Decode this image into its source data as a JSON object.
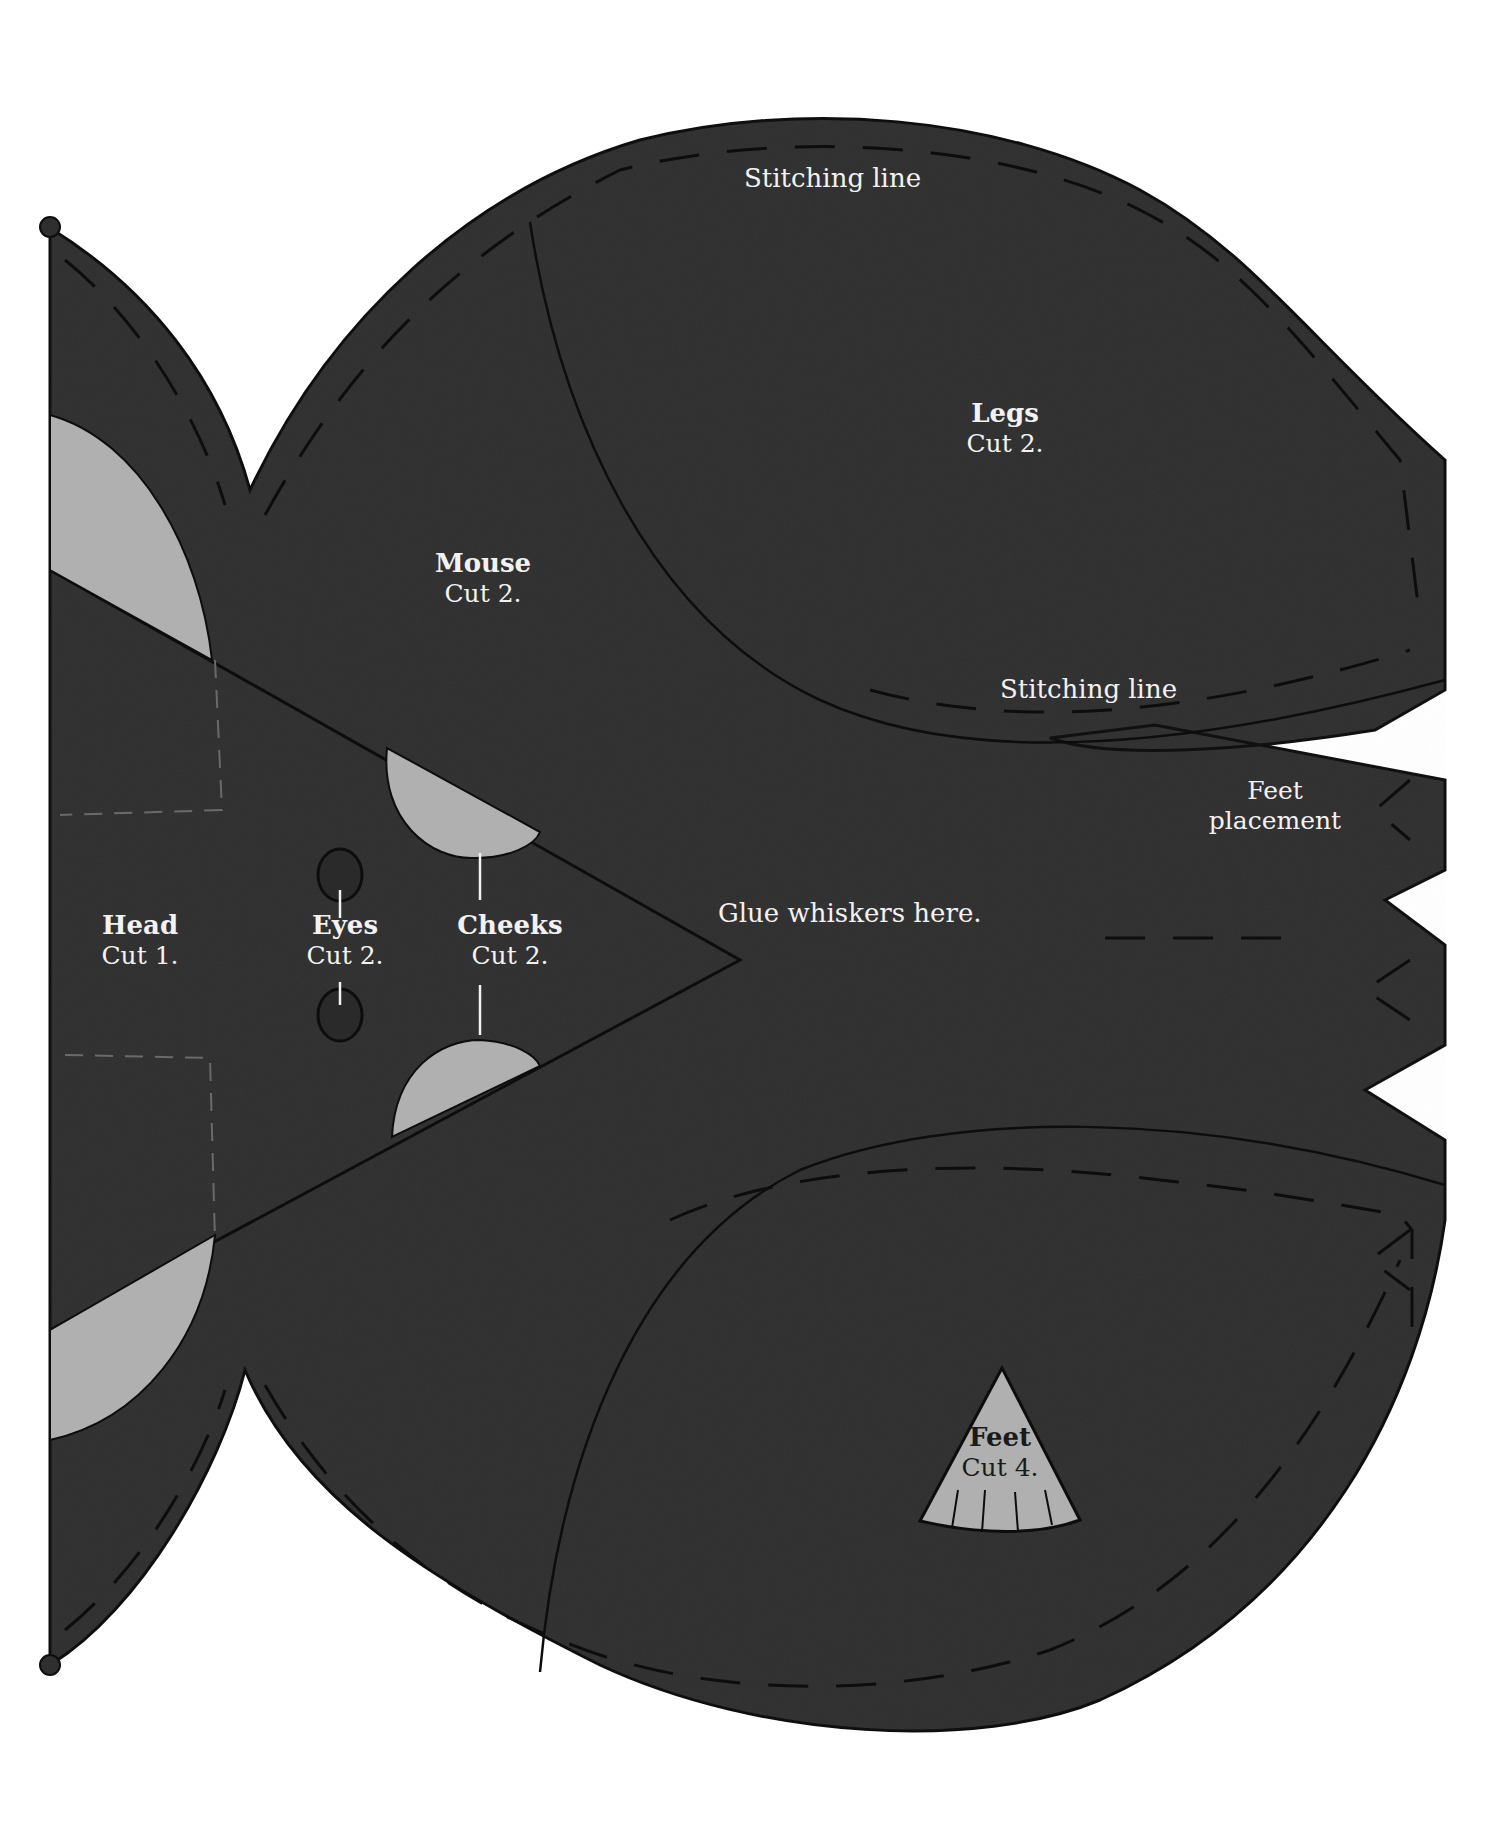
{
  "document": {
    "type": "sewing-pattern",
    "colors": {
      "paper": "#ffffff",
      "fabric": "#2f2f2f",
      "outline": "#0d0d0d",
      "accent_pieces": "#b0b0b0",
      "label_text": "#f2f2f2",
      "label_text_on_light": "#1a1a1a"
    }
  },
  "labels": {
    "stitching_top": "Stitching line",
    "stitching_legs": "Stitching line",
    "legs": {
      "title": "Legs",
      "cut": "Cut 2."
    },
    "mouse": {
      "title": "Mouse",
      "cut": "Cut 2."
    },
    "head": {
      "title": "Head",
      "cut": "Cut 1."
    },
    "eyes": {
      "title": "Eyes",
      "cut": "Cut 2."
    },
    "cheeks": {
      "title": "Cheeks",
      "cut": "Cut 2."
    },
    "feet": {
      "title": "Feet",
      "cut": "Cut 4."
    },
    "feet_placement": {
      "line1": "Feet",
      "line2": "placement"
    },
    "glue_whiskers": "Glue whiskers here."
  }
}
